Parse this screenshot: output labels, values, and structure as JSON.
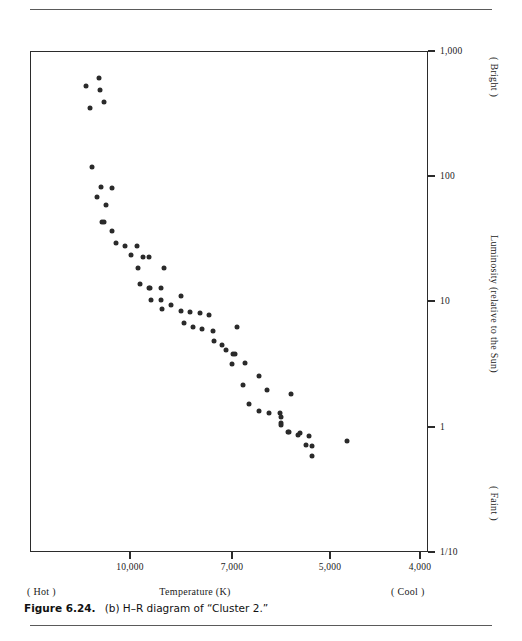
{
  "figure": {
    "caption_label": "Figure 6.24.",
    "caption_text": "(b) H–R diagram of “Cluster 2.”"
  },
  "axes": {
    "x_title": "Temperature (K)",
    "x_left_note": "( Hot )",
    "x_right_note": "( Cool )",
    "y_title": "Luminosity (relative to the Sun)",
    "y_top_note": "( Bright )",
    "y_bottom_note": "( Faint )",
    "x_ticks": [
      {
        "label": "10,000",
        "value": 10000,
        "px": 130
      },
      {
        "label": "7,000",
        "value": 7000,
        "px": 232
      },
      {
        "label": "5,000",
        "value": 5000,
        "px": 330
      },
      {
        "label": "4,000",
        "value": 4000,
        "px": 420
      }
    ],
    "y_ticks": [
      {
        "label": "1,000",
        "value": 1000,
        "px": 51
      },
      {
        "label": "100",
        "value": 100,
        "px": 176
      },
      {
        "label": "10",
        "value": 10,
        "px": 301
      },
      {
        "label": "1",
        "value": 1,
        "px": 427
      },
      {
        "label": "1/10",
        "value": 0.1,
        "px": 552
      }
    ]
  },
  "chart_data": {
    "type": "scatter",
    "title": "H–R diagram of “Cluster 2.”",
    "xlabel": "Temperature (K)",
    "ylabel": "Luminosity (relative to the Sun)",
    "xscale": "log-reversed",
    "yscale": "log",
    "xlim": [
      13000,
      3700
    ],
    "ylim": [
      0.1,
      1000
    ],
    "grid": false,
    "legend": null,
    "marker": "filled-circle",
    "marker_color": "#2a2a2a",
    "series_name": "Cluster 2 stars",
    "annotations": [
      "( Hot )",
      "( Cool )",
      "( Bright )",
      "( Faint )"
    ],
    "points": [
      {
        "x": 11700,
        "y": 540
      },
      {
        "x": 11200,
        "y": 620
      },
      {
        "x": 11150,
        "y": 500
      },
      {
        "x": 11000,
        "y": 400
      },
      {
        "x": 11550,
        "y": 360
      },
      {
        "x": 11450,
        "y": 120
      },
      {
        "x": 11100,
        "y": 83
      },
      {
        "x": 10700,
        "y": 82
      },
      {
        "x": 11250,
        "y": 70
      },
      {
        "x": 10900,
        "y": 60
      },
      {
        "x": 11050,
        "y": 44
      },
      {
        "x": 11000,
        "y": 44
      },
      {
        "x": 10700,
        "y": 37
      },
      {
        "x": 10550,
        "y": 30
      },
      {
        "x": 10200,
        "y": 28
      },
      {
        "x": 9800,
        "y": 28
      },
      {
        "x": 10000,
        "y": 24
      },
      {
        "x": 9600,
        "y": 23
      },
      {
        "x": 9400,
        "y": 23
      },
      {
        "x": 9750,
        "y": 19
      },
      {
        "x": 8900,
        "y": 19
      },
      {
        "x": 9700,
        "y": 14
      },
      {
        "x": 9400,
        "y": 13
      },
      {
        "x": 9350,
        "y": 13
      },
      {
        "x": 9000,
        "y": 13
      },
      {
        "x": 9320,
        "y": 10.5
      },
      {
        "x": 9000,
        "y": 10.4
      },
      {
        "x": 8400,
        "y": 11.2
      },
      {
        "x": 8980,
        "y": 8.9
      },
      {
        "x": 8700,
        "y": 9.6
      },
      {
        "x": 8400,
        "y": 8.6
      },
      {
        "x": 8130,
        "y": 8.4
      },
      {
        "x": 7850,
        "y": 8.2
      },
      {
        "x": 7600,
        "y": 8.0
      },
      {
        "x": 8300,
        "y": 6.8
      },
      {
        "x": 8050,
        "y": 6.4
      },
      {
        "x": 7800,
        "y": 6.1
      },
      {
        "x": 7500,
        "y": 5.9
      },
      {
        "x": 6900,
        "y": 6.4
      },
      {
        "x": 7280,
        "y": 4.6
      },
      {
        "x": 7000,
        "y": 3.9
      },
      {
        "x": 6720,
        "y": 3.3
      },
      {
        "x": 7470,
        "y": 4.9
      },
      {
        "x": 7180,
        "y": 4.2
      },
      {
        "x": 6960,
        "y": 3.9
      },
      {
        "x": 7020,
        "y": 3.2
      },
      {
        "x": 6760,
        "y": 2.2
      },
      {
        "x": 6400,
        "y": 2.6
      },
      {
        "x": 6230,
        "y": 2.0
      },
      {
        "x": 5730,
        "y": 1.85
      },
      {
        "x": 6620,
        "y": 1.55
      },
      {
        "x": 6400,
        "y": 1.36
      },
      {
        "x": 6180,
        "y": 1.31
      },
      {
        "x": 5960,
        "y": 1.31
      },
      {
        "x": 5940,
        "y": 1.1
      },
      {
        "x": 5790,
        "y": 0.92
      },
      {
        "x": 5560,
        "y": 0.9
      },
      {
        "x": 5930,
        "y": 1.22
      },
      {
        "x": 5930,
        "y": 1.05
      },
      {
        "x": 5780,
        "y": 0.92
      },
      {
        "x": 5600,
        "y": 0.88
      },
      {
        "x": 5390,
        "y": 0.86
      },
      {
        "x": 5450,
        "y": 0.73
      },
      {
        "x": 5330,
        "y": 0.72
      },
      {
        "x": 5330,
        "y": 0.6
      },
      {
        "x": 4800,
        "y": 0.79
      }
    ]
  }
}
